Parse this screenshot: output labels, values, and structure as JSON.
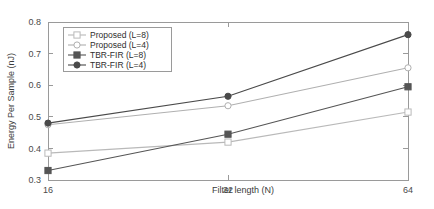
{
  "chart_data": {
    "type": "line",
    "title": "",
    "xlabel": "Filter length (N)",
    "ylabel": "Energy Per Sample (nJ)",
    "x": [
      16,
      32,
      64
    ],
    "xticklabels": [
      "16",
      "32",
      "64"
    ],
    "yticklabels": [
      "0.3",
      "0.4",
      "0.5",
      "0.6",
      "0.7",
      "0.8"
    ],
    "yticks": [
      0.3,
      0.4,
      0.5,
      0.6,
      0.7,
      0.8
    ],
    "ylim": [
      0.3,
      0.8
    ],
    "xscale": "log2",
    "grid": false,
    "legend_position": "upper left",
    "series": [
      {
        "name": "Proposed (L=8)",
        "values": [
          0.385,
          0.42,
          0.515
        ],
        "color": "#b9b9b9",
        "marker": "square-open"
      },
      {
        "name": "Proposed (L=4)",
        "values": [
          0.475,
          0.535,
          0.655
        ],
        "color": "#b0b0b0",
        "marker": "circle-open"
      },
      {
        "name": "TBR-FIR (L=8)",
        "values": [
          0.33,
          0.445,
          0.595
        ],
        "color": "#555555",
        "marker": "square-filled"
      },
      {
        "name": "TBR-FIR (L=4)",
        "values": [
          0.48,
          0.565,
          0.76
        ],
        "color": "#4a4a4a",
        "marker": "circle-filled"
      }
    ]
  }
}
